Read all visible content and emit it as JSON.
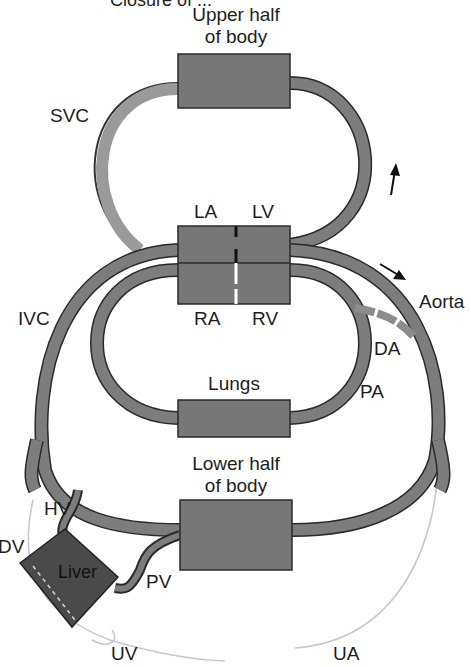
{
  "diagram": {
    "title_partial": "Closure of ...",
    "type": "fetal circulation schematic",
    "boxes": [
      {
        "id": "upper",
        "label_line1": "Upper half",
        "label_line2": "of body"
      },
      {
        "id": "heart",
        "chambers": [
          "LA",
          "LV",
          "RA",
          "RV"
        ]
      },
      {
        "id": "lungs",
        "label": "Lungs"
      },
      {
        "id": "lower",
        "label_line1": "Lower half",
        "label_line2": "of body"
      },
      {
        "id": "liver",
        "label": "Liver"
      }
    ],
    "vessel_labels": {
      "svc": "SVC",
      "ivc": "IVC",
      "aorta": "Aorta",
      "da": "DA",
      "pa": "PA",
      "hv": "HV",
      "dv": "DV",
      "pv": "PV",
      "uv": "UV",
      "ua": "UA"
    },
    "chamber_labels": {
      "la": "LA",
      "lv": "LV",
      "ra": "RA",
      "rv": "RV"
    },
    "arrows": [
      {
        "name": "upward-flow-arrow",
        "direction": "up"
      },
      {
        "name": "aortic-flow-arrow",
        "direction": "down-right"
      }
    ],
    "colors": {
      "box_fill": "#777777",
      "vessel_fill": "#7d7d7d",
      "outline": "#2a2a2a",
      "liver_fill": "#4a4a4a",
      "umbilical_line": "#c8c8c8",
      "text": "#1e1e1e"
    }
  }
}
